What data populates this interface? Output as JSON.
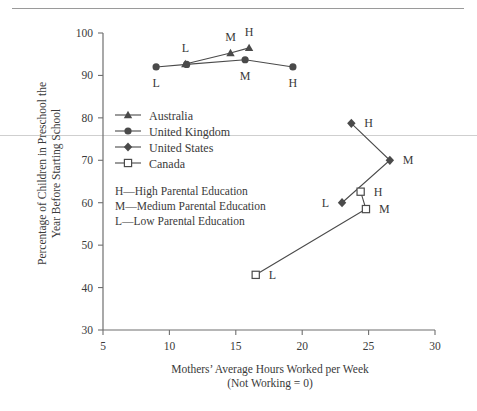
{
  "chart_data": {
    "type": "line",
    "title": "",
    "xlabel": "Mothers’ Average Hours Worked per Week",
    "xlabel_line2": "(Not Working = 0)",
    "ylabel": "Percentage of Children in Preschool the",
    "ylabel_line2": "Year Before Starting School",
    "xlim": [
      5,
      30
    ],
    "ylim": [
      30,
      100
    ],
    "xticks": [
      5,
      10,
      15,
      20,
      25,
      30
    ],
    "yticks": [
      30,
      40,
      50,
      60,
      70,
      80,
      90,
      100
    ],
    "grid": false,
    "legend_position": "inside-left",
    "series": [
      {
        "name": "Australia",
        "marker": "triangle",
        "points": [
          {
            "label": "L",
            "x": 11.2,
            "y": 92.7,
            "label_pos": "above"
          },
          {
            "label": "M",
            "x": 14.6,
            "y": 95.3,
            "label_pos": "above"
          },
          {
            "label": "H",
            "x": 16.0,
            "y": 96.5,
            "label_pos": "above"
          }
        ]
      },
      {
        "name": "United Kingdom",
        "marker": "circle",
        "points": [
          {
            "label": "L",
            "x": 9.0,
            "y": 92.0,
            "label_pos": "below"
          },
          {
            "label": "",
            "x": 11.3,
            "y": 92.6,
            "label_pos": "none"
          },
          {
            "label": "M",
            "x": 15.7,
            "y": 93.7,
            "label_pos": "below"
          },
          {
            "label": "H",
            "x": 19.3,
            "y": 92.0,
            "label_pos": "below"
          }
        ]
      },
      {
        "name": "United States",
        "marker": "diamond",
        "points": [
          {
            "label": "H",
            "x": 23.7,
            "y": 78.7,
            "label_pos": "right"
          },
          {
            "label": "M",
            "x": 26.6,
            "y": 70.0,
            "label_pos": "right"
          },
          {
            "label": "L",
            "x": 23.0,
            "y": 60.0,
            "label_pos": "left"
          }
        ]
      },
      {
        "name": "Canada",
        "marker": "open-square",
        "points": [
          {
            "label": "H",
            "x": 24.4,
            "y": 62.6,
            "label_pos": "right"
          },
          {
            "label": "M",
            "x": 24.8,
            "y": 58.5,
            "label_pos": "right"
          },
          {
            "label": "L",
            "x": 16.5,
            "y": 43.0,
            "label_pos": "right"
          }
        ]
      }
    ],
    "legend": [
      {
        "name": "Australia",
        "marker": "triangle"
      },
      {
        "name": "United Kingdom",
        "marker": "circle"
      },
      {
        "name": "United States",
        "marker": "diamond"
      },
      {
        "name": "Canada",
        "marker": "open-square"
      }
    ],
    "annotations": [
      "H—High Parental Education",
      "M—Medium Parental Education",
      "L—Low Parental Education"
    ],
    "colors": {
      "line": "#4a4a4a",
      "axis": "#6f6f6f",
      "text": "#3a3a3a",
      "background": "#ffffff"
    }
  }
}
